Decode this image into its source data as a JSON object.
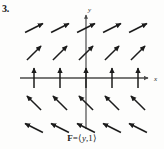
{
  "problem": {
    "number": "3."
  },
  "caption": {
    "field_name": "F",
    "equals": "=",
    "open_bracket": "⟨",
    "component_x": "y",
    "separator": ",",
    "component_y": "1",
    "close_bracket": "⟩",
    "full_text": "F = ⟨y, 1⟩"
  },
  "axes": {
    "x_label": "x",
    "y_label": "y",
    "x_axis_color": "#4a4a4a",
    "y_axis_color": "#4a4a4a",
    "origin_x": 86,
    "origin_y": 78,
    "x_min_px": 20,
    "x_max_px": 152,
    "y_min_px": 12,
    "y_max_px": 129
  },
  "style": {
    "arrow_color": "#1b1b1b",
    "background": "#fdfdfc",
    "arrow_stroke_width": 1.5
  },
  "chart_data": {
    "type": "quiver",
    "xlabel": "x",
    "ylabel": "y",
    "xlim": [
      -2.5,
      2.5
    ],
    "ylim": [
      -2.5,
      2.5
    ],
    "grid": false,
    "legend": null,
    "x": [
      -2,
      -1,
      0,
      1,
      2
    ],
    "y": [
      -2,
      -1,
      0,
      1,
      2
    ],
    "vectors": [
      {
        "x": -2,
        "y": 2,
        "u": 2,
        "v": 1
      },
      {
        "x": -1,
        "y": 2,
        "u": 2,
        "v": 1
      },
      {
        "x": 0,
        "y": 2,
        "u": 2,
        "v": 1
      },
      {
        "x": 1,
        "y": 2,
        "u": 2,
        "v": 1
      },
      {
        "x": 2,
        "y": 2,
        "u": 2,
        "v": 1
      },
      {
        "x": -2,
        "y": 1,
        "u": 1,
        "v": 1
      },
      {
        "x": -1,
        "y": 1,
        "u": 1,
        "v": 1
      },
      {
        "x": 0,
        "y": 1,
        "u": 1,
        "v": 1
      },
      {
        "x": 1,
        "y": 1,
        "u": 1,
        "v": 1
      },
      {
        "x": 2,
        "y": 1,
        "u": 1,
        "v": 1
      },
      {
        "x": -2,
        "y": 0,
        "u": 0,
        "v": 1
      },
      {
        "x": -1,
        "y": 0,
        "u": 0,
        "v": 1
      },
      {
        "x": 0,
        "y": 0,
        "u": 0,
        "v": 1
      },
      {
        "x": 1,
        "y": 0,
        "u": 0,
        "v": 1
      },
      {
        "x": 2,
        "y": 0,
        "u": 0,
        "v": 1
      },
      {
        "x": -2,
        "y": -1,
        "u": -1,
        "v": 1
      },
      {
        "x": -1,
        "y": -1,
        "u": -1,
        "v": 1
      },
      {
        "x": 0,
        "y": -1,
        "u": -1,
        "v": 1
      },
      {
        "x": 1,
        "y": -1,
        "u": -1,
        "v": 1
      },
      {
        "x": 2,
        "y": -1,
        "u": -1,
        "v": 1
      },
      {
        "x": -2,
        "y": -2,
        "u": -2,
        "v": 1
      },
      {
        "x": -1,
        "y": -2,
        "u": -2,
        "v": 1
      },
      {
        "x": 0,
        "y": -2,
        "u": -2,
        "v": 1
      },
      {
        "x": 1,
        "y": -2,
        "u": -2,
        "v": 1
      },
      {
        "x": 2,
        "y": -2,
        "u": -2,
        "v": 1
      }
    ]
  }
}
